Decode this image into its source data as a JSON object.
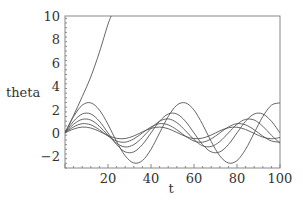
{
  "chart_data": {
    "type": "line",
    "title": "",
    "xlabel": "t",
    "ylabel": "theta",
    "xlim": [
      0,
      100
    ],
    "ylim": [
      -3,
      10
    ],
    "xticks": [
      20,
      40,
      60,
      80,
      100
    ],
    "yticks": [
      -2,
      0,
      2,
      4,
      6,
      8,
      10
    ],
    "xtick_labels": [
      "20",
      "40",
      "60",
      "80",
      "100"
    ],
    "ytick_labels": [
      "−2",
      "0",
      "2",
      "4",
      "6",
      "8",
      "10"
    ],
    "grid": false,
    "legend": "none",
    "x": [
      0,
      4,
      8,
      12,
      16,
      20,
      24,
      28,
      32,
      36,
      40,
      44,
      48,
      52,
      56,
      60,
      64,
      68,
      72,
      76,
      80,
      84,
      88,
      92,
      96,
      100
    ],
    "series": [
      {
        "name": "runaway",
        "x": [
          0,
          4,
          8,
          12,
          16,
          20,
          22
        ],
        "values": [
          0,
          1.5,
          3.1,
          4.8,
          6.9,
          9.3,
          10.2
        ]
      },
      {
        "name": "amplitude-2.6",
        "values": [
          0,
          1.4,
          2.37,
          2.57,
          1.96,
          0.73,
          -0.73,
          -1.96,
          -2.57,
          -2.37,
          -1.4,
          0,
          1.4,
          2.37,
          2.57,
          1.96,
          0.73,
          -0.73,
          -1.96,
          -2.57,
          -2.37,
          -1.4,
          0,
          1.4,
          2.37,
          2.57
        ]
      },
      {
        "name": "amplitude-1.7",
        "values": [
          0,
          1.0,
          1.62,
          1.62,
          1.0,
          0,
          -1.0,
          -1.62,
          -1.62,
          -1.0,
          0,
          1.0,
          1.62,
          1.62,
          1.0,
          0,
          -1.0,
          -1.62,
          -1.62,
          -1.0,
          0,
          1.0,
          1.62,
          1.62,
          1.0,
          0
        ]
      },
      {
        "name": "amplitude-1.2",
        "values": [
          0,
          0.74,
          1.16,
          1.1,
          0.57,
          -0.2,
          -0.88,
          -1.2,
          -1.0,
          -0.39,
          0.39,
          1.0,
          1.2,
          0.88,
          0.2,
          -0.57,
          -1.1,
          -1.16,
          -0.74,
          0,
          0.74,
          1.16,
          1.1,
          0.57,
          -0.2,
          -0.88
        ]
      },
      {
        "name": "amplitude-0.8",
        "values": [
          0,
          0.51,
          0.79,
          0.69,
          0.27,
          -0.27,
          -0.69,
          -0.79,
          -0.51,
          0,
          0.51,
          0.79,
          0.69,
          0.27,
          -0.27,
          -0.69,
          -0.79,
          -0.51,
          0,
          0.51,
          0.79,
          0.69,
          0.27,
          -0.27,
          -0.69,
          -0.79
        ]
      },
      {
        "name": "amplitude-0.5",
        "values": [
          0,
          0.33,
          0.5,
          0.42,
          0.13,
          -0.22,
          -0.46,
          -0.48,
          -0.26,
          0.09,
          0.39,
          0.5,
          0.36,
          0.04,
          -0.29,
          -0.49,
          -0.44,
          -0.18,
          0.18,
          0.44,
          0.49,
          0.29,
          -0.04,
          -0.36,
          -0.5,
          -0.39
        ]
      }
    ]
  }
}
